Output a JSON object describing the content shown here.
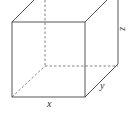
{
  "diagram": {
    "type": "rectangular-box",
    "labels": {
      "x": "x",
      "y": "y",
      "z": "z"
    },
    "colors": {
      "line": "#444444",
      "dashed": "#666666"
    }
  }
}
